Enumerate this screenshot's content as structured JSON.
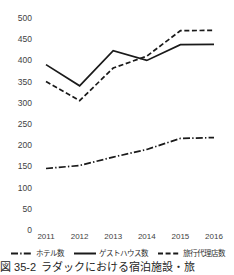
{
  "chart_data": {
    "type": "line",
    "title": "",
    "xlabel": "",
    "ylabel": "",
    "categories": [
      "2011",
      "2012",
      "2013",
      "2014",
      "2015",
      "2016"
    ],
    "ylim": [
      0,
      500
    ],
    "y_ticks": [
      0,
      50,
      100,
      150,
      200,
      250,
      300,
      350,
      400,
      450,
      500
    ],
    "grid": false,
    "legend_position": "bottom",
    "series": [
      {
        "name": "ホテル数",
        "style": "dash-dot",
        "color": "#1a1a1a",
        "values": [
          145,
          152,
          172,
          190,
          216,
          218
        ]
      },
      {
        "name": "ゲストハウス数",
        "style": "solid",
        "color": "#1a1a1a",
        "values": [
          390,
          340,
          423,
          400,
          437,
          438
        ]
      },
      {
        "name": "旅行代理店数",
        "style": "dashed",
        "color": "#1a1a1a",
        "values": [
          350,
          305,
          382,
          410,
          470,
          471
        ]
      }
    ]
  },
  "axis": {
    "y_tick_labels": [
      "500",
      "450",
      "400",
      "350",
      "300",
      "250",
      "200",
      "150",
      "100",
      "50",
      "0"
    ],
    "x_tick_labels": [
      "2011",
      "2012",
      "2013",
      "2014",
      "2015",
      "2016"
    ]
  },
  "legend": {
    "items": [
      {
        "label": "ホテル数",
        "style": "dash-dot"
      },
      {
        "label": "ゲストハウス数",
        "style": "solid"
      },
      {
        "label": "旅行代理店数",
        "style": "dashed"
      }
    ]
  },
  "caption": {
    "number": "図 35-2",
    "text": "ラダックにおける宿泊施設・旅"
  }
}
